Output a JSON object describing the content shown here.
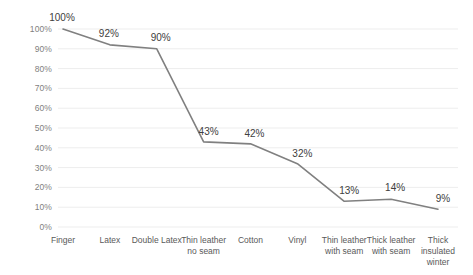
{
  "chart_data": {
    "type": "line",
    "title": "",
    "subtitle": "",
    "xlabel": "",
    "ylabel": "",
    "categories": [
      "Finger",
      "Latex",
      "Double Latex",
      "Thin leather no seam",
      "Cotton",
      "Vinyl",
      "Thin leather with seam",
      "Thick leather with seam",
      "Thick insulated winter"
    ],
    "values": [
      100,
      92,
      90,
      43,
      42,
      32,
      13,
      14,
      9
    ],
    "point_labels": [
      "100%",
      "92%",
      "90%",
      "43%",
      "42%",
      "32%",
      "13%",
      "14%",
      "9%"
    ],
    "ylim": [
      0,
      100
    ],
    "ytick_values": [
      0,
      10,
      20,
      30,
      40,
      50,
      60,
      70,
      80,
      90,
      100
    ],
    "ytick_labels": [
      "0%",
      "10%",
      "20%",
      "30%",
      "40%",
      "50%",
      "60%",
      "70%",
      "80%",
      "90%",
      "100%"
    ],
    "grid": true,
    "grid_axis": "y",
    "legend": false,
    "legend_position": "none",
    "series_color": "#808080",
    "gridline_color": "#ededed",
    "tick_label_color": "#7f7f7f",
    "category_label_color": "#595959",
    "data_label_color": "#404040",
    "background_color": "#ffffff",
    "series": [
      {
        "name": "Dexterity retained",
        "values": [
          100,
          92,
          90,
          43,
          42,
          32,
          13,
          14,
          9
        ]
      }
    ]
  }
}
